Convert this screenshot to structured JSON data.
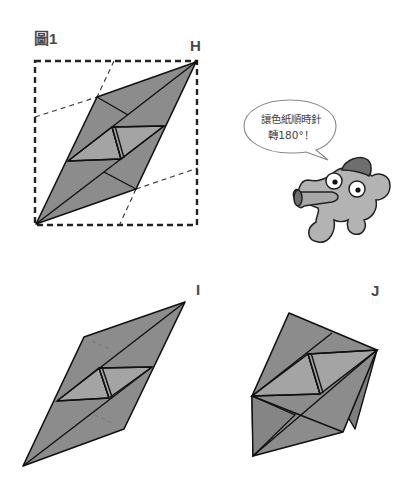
{
  "figure": {
    "title": "圖1",
    "labels": {
      "h": "H",
      "i": "I",
      "j": "J"
    }
  },
  "speech_bubble": {
    "line1": "讓色紙順時針",
    "line2": "轉180°！"
  },
  "colors": {
    "paper_dark": "#8c8c8c",
    "paper_light": "#a4a4a4",
    "outline": "#111111",
    "dashed_frame": "#222222",
    "mascot_body": "#b3b3b3",
    "mascot_dark": "#6e6e6e",
    "label_text": "#4a4a4a"
  },
  "diagrams": [
    {
      "id": "figure-1",
      "description": "Folded paper rhombus inside dashed square, corner H at top-right"
    },
    {
      "id": "step-i",
      "description": "Paper rotated rhombus, corner I at top-right"
    },
    {
      "id": "step-j",
      "description": "Folded pentagon shape with flap on right"
    }
  ]
}
